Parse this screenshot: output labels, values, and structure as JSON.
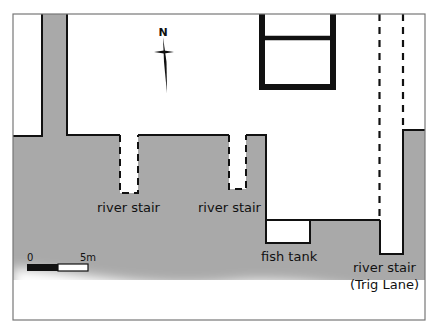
{
  "map": {
    "title": "",
    "colors": {
      "land": "#ffffff",
      "river": "#a9a9a9",
      "wall": "#111111",
      "frame": "#777777"
    },
    "compass": {
      "label": "N"
    },
    "scale_bar": {
      "start_label": "0",
      "end_label": "5m"
    },
    "labels": {
      "river_stair_1": "river stair",
      "river_stair_2": "river stair",
      "fish_tank": "fish tank",
      "river_stair_trig_1": "river stair",
      "river_stair_trig_2": "(Trig Lane)"
    }
  }
}
